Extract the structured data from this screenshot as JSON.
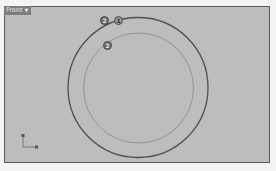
{
  "viewport": {
    "name": "Front",
    "dropdown_icon": "chevron-down-icon",
    "background": "#bdbdbd"
  },
  "scene": {
    "outer_circle": {
      "cx": 138,
      "cy": 87.5,
      "r": 70,
      "stroke": "#4e4e4e"
    },
    "inner_circle": {
      "cx": 138.5,
      "cy": 88,
      "r": 55,
      "stroke": "#8a8a8a"
    }
  },
  "markers": [
    {
      "label": "2",
      "x": 100,
      "y": 16
    },
    {
      "label": "1",
      "x": 114,
      "y": 16
    },
    {
      "label": "2",
      "x": 103,
      "y": 41
    }
  ],
  "axes": {
    "x_label": "x",
    "y_label": "z"
  }
}
